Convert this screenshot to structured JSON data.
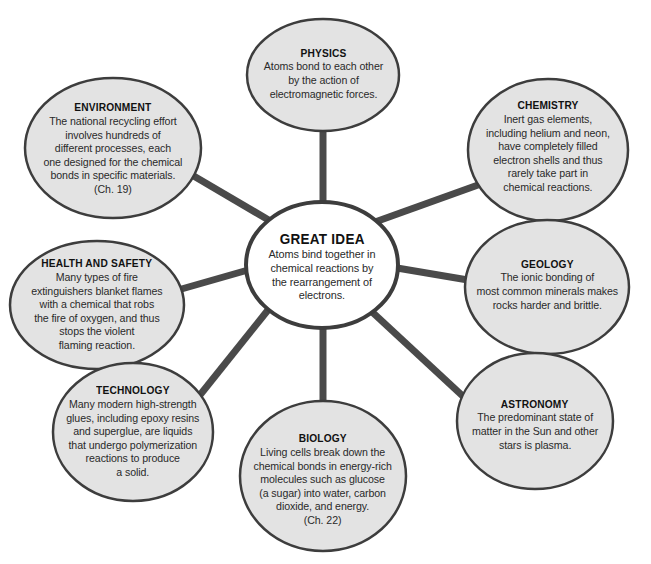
{
  "colors": {
    "background": "#ffffff",
    "bubble_fill": "#e3e3e3",
    "bubble_stroke": "#3d3d3d",
    "center_fill": "#ffffff",
    "spoke": "#4a4a4a",
    "text": "#2a2a2a"
  },
  "center": {
    "title": "GREAT IDEA",
    "body": "Atoms bind together in\nchemical reactions by\nthe rearrangement of\nelectrons."
  },
  "nodes": [
    {
      "id": "physics",
      "title": "PHYSICS",
      "body": "Atoms bond to each other\nby the action of\nelectromagnetic forces."
    },
    {
      "id": "chemistry",
      "title": "CHEMISTRY",
      "body": "Inert gas elements,\nincluding helium and neon,\nhave completely filled\nelectron shells and thus\nrarely take part in\nchemical reactions."
    },
    {
      "id": "geology",
      "title": "GEOLOGY",
      "body": "The ionic bonding of\nmost common minerals makes\nrocks harder and brittle."
    },
    {
      "id": "astronomy",
      "title": "ASTRONOMY",
      "body": "The predominant state of\nmatter in the Sun and other\nstars is plasma."
    },
    {
      "id": "biology",
      "title": "BIOLOGY",
      "body": "Living cells break down the\nchemical bonds in energy-rich\nmolecules such as glucose\n(a sugar) into water, carbon\ndioxide, and energy.\n(Ch. 22)"
    },
    {
      "id": "technology",
      "title": "TECHNOLOGY",
      "body": "Many modern high-strength\nglues, including epoxy resins\nand superglue, are liquids\nthat undergo polymerization\nreactions to produce\na solid."
    },
    {
      "id": "health-and-safety",
      "title": "HEALTH AND SAFETY",
      "body": "Many types of fire\nextinguishers blanket flames\nwith a chemical that robs\nthe fire of oxygen, and thus\nstops the violent\nflaming reaction."
    },
    {
      "id": "environment",
      "title": "ENVIRONMENT",
      "body": "The national recycling effort\ninvolves hundreds of\ndifferent processes, each\none designed for the chemical\nbonds in specific materials.\n(Ch. 19)"
    }
  ]
}
